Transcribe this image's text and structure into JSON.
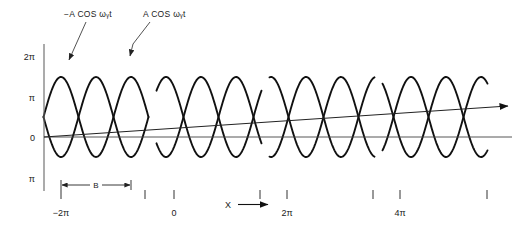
{
  "figure": {
    "title": "",
    "background_color": "#ffffff",
    "wave_color": "#111111",
    "axis_color": "#555555",
    "leader_color": "#333333"
  },
  "callouts": [
    {
      "id": "left",
      "text": "−A COS ωᵧt",
      "x": 112,
      "y": 17,
      "anchor": "end",
      "leader": "straight-arrow"
    },
    {
      "id": "right",
      "text": "A COS ωᵧt",
      "x": 143,
      "y": 17,
      "anchor": "start",
      "leader": "elbow-arrow"
    }
  ],
  "y_axis": {
    "label": "",
    "line": {
      "x": 44,
      "y_top": 44,
      "y_bottom": 191
    },
    "ticks": [
      {
        "label": "2π",
        "y": 56
      },
      {
        "label": "π",
        "y": 97
      },
      {
        "label": "0",
        "y": 137
      },
      {
        "label": "π",
        "y": 178
      }
    ]
  },
  "x_axis": {
    "label": "X",
    "arrow": "→",
    "zero_line_y": 137,
    "ticks": [
      {
        "label": "−2π",
        "x": 61
      },
      {
        "label": "0",
        "x": 174
      },
      {
        "label": "2π",
        "x": 287
      },
      {
        "label": "4π",
        "x": 400
      }
    ],
    "unlabeled_ticks_x": [
      145,
      260,
      373,
      487
    ]
  },
  "dimension": {
    "label": "B",
    "x_start": 61,
    "x_end": 131,
    "y": 185
  },
  "chart_data": {
    "type": "line",
    "title": "",
    "xlabel": "X",
    "ylabel": "",
    "grid": false,
    "legend": "callout-annotations",
    "xlim": [
      -2,
      5.6
    ],
    "ylim": [
      -1.6,
      2.6
    ],
    "x_tick_values": [
      -2,
      0,
      2,
      4
    ],
    "x_tick_labels": [
      "−2π",
      "0",
      "2π",
      "4π"
    ],
    "y_tick_values": [
      2,
      1,
      0,
      -1
    ],
    "y_tick_labels": [
      "2π",
      "π",
      "0",
      "π"
    ],
    "series": [
      {
        "name": "A COS ωᵧt",
        "amplitude": 1.0,
        "phase": 0.0,
        "color": "#111111"
      },
      {
        "name": "−A COS ωᵧt",
        "amplitude": -1.0,
        "phase": 0.0,
        "color": "#111111"
      }
    ],
    "packets": [
      {
        "index": 1,
        "center_x": 96,
        "x_left": 61,
        "x_right": 131
      },
      {
        "index": 2,
        "center_x": 209,
        "x_left": 174,
        "x_right": 244
      },
      {
        "index": 3,
        "center_x": 322,
        "x_left": 287,
        "x_right": 357
      },
      {
        "index": 4,
        "center_x": 435,
        "x_left": 400,
        "x_right": 470
      }
    ],
    "packet_spacing_px": 113,
    "envelope_note": "Each packet is a pair of counter-phase cosine waves forming a braided lens pattern",
    "diagonal_ray": {
      "name": "ray",
      "x_start": 44,
      "y_start": 137,
      "x_end": 508,
      "y_end": 106,
      "arrow": true
    },
    "horizontal_ray": {
      "name": "axis-ray",
      "x_start": 44,
      "y_start": 137,
      "x_end": 512,
      "y_end": 137
    }
  }
}
